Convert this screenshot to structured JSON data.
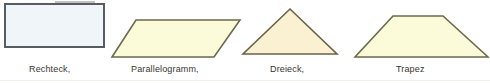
{
  "page": {
    "width": 490,
    "height": 83,
    "background": "#ffffff",
    "text_color": "#3a352f",
    "kind": "geometry-shapes-figure"
  },
  "figures": [
    {
      "name": "rectangle",
      "caption": "Rechteck,",
      "shape": "rectangle",
      "fill": "#eff5f8",
      "stroke": "#565c61",
      "stroke_width": 2,
      "box": {
        "x": 4,
        "y": 3,
        "width": 102,
        "height": 46
      },
      "points": "5,4 104,4 104,47 5,47",
      "caption_pos": {
        "x": 29,
        "y": 64
      }
    },
    {
      "name": "parallelogram",
      "caption": "Parallelogramm,",
      "shape": "parallelogram",
      "fill": "#fbfbd9",
      "stroke": "#6b6a4e",
      "stroke_width": 1.6,
      "box": {
        "x": 110,
        "y": 18,
        "width": 132,
        "height": 41
      },
      "points": "136,20 240,20 214,57 112,57",
      "caption_pos": {
        "x": 131,
        "y": 64
      }
    },
    {
      "name": "triangle",
      "caption": "Dreieck,",
      "shape": "triangle",
      "fill": "#faf0d2",
      "stroke": "#6b6248",
      "stroke_width": 1.6,
      "box": {
        "x": 241,
        "y": 7,
        "width": 98,
        "height": 50
      },
      "points": "290,9 337,54 243,54",
      "caption_pos": {
        "x": 270,
        "y": 64
      }
    },
    {
      "name": "trapezoid",
      "caption": "Trapez",
      "shape": "trapezoid",
      "fill": "#fbfbd9",
      "stroke": "#6b6a4e",
      "stroke_width": 1.6,
      "box": {
        "x": 353,
        "y": 14,
        "width": 137,
        "height": 45
      },
      "points": "393,16 443,16 488,57 355,57",
      "caption_pos": {
        "x": 396,
        "y": 64
      }
    }
  ]
}
